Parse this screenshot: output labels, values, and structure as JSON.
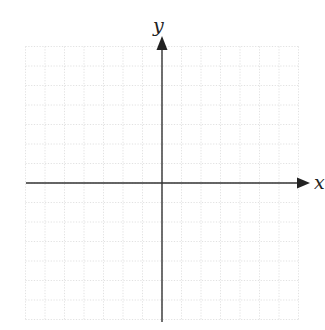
{
  "diagram": {
    "type": "coordinate-plane",
    "x_axis_label": "x",
    "y_axis_label": "y",
    "grid": {
      "cells_left": 7,
      "cells_right": 7,
      "cells_up": 7,
      "cells_down": 7,
      "style": "dotted",
      "color": "#d9d9d9"
    },
    "axis_color": "#333333",
    "origin_px": [
      162,
      183
    ],
    "cell_px": 19.5
  }
}
